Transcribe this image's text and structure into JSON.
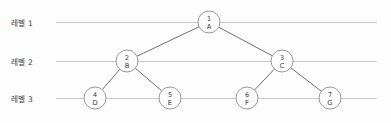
{
  "diagram": {
    "type": "binary-tree",
    "title": "",
    "background_color": "#fdfdfd",
    "level_line_color": "#c9c9c9",
    "edge_color": "#6f6f72",
    "node_stroke_color": "#8d8d91",
    "node_fill_color": "#fdfdfd",
    "levels": [
      {
        "label": "레벨 1",
        "y": 22,
        "line_start_x": 56,
        "line_end_x": 377
      },
      {
        "label": "레벨 2",
        "y": 61,
        "line_start_x": 56,
        "line_end_x": 377
      },
      {
        "label": "레벨 3",
        "y": 98,
        "line_start_x": 56,
        "line_end_x": 377
      }
    ],
    "nodes": [
      {
        "id": "A",
        "number": "1",
        "letter": "A",
        "cx": 209,
        "cy": 22,
        "r": 11,
        "level": 1
      },
      {
        "id": "B",
        "number": "2",
        "letter": "B",
        "cx": 127,
        "cy": 61,
        "r": 11,
        "level": 2
      },
      {
        "id": "C",
        "number": "3",
        "letter": "C",
        "cx": 282,
        "cy": 61,
        "r": 11,
        "level": 2
      },
      {
        "id": "D",
        "number": "4",
        "letter": "D",
        "cx": 95,
        "cy": 98,
        "r": 11,
        "level": 3
      },
      {
        "id": "E",
        "number": "5",
        "letter": "E",
        "cx": 170,
        "cy": 98,
        "r": 11,
        "level": 3
      },
      {
        "id": "F",
        "number": "6",
        "letter": "F",
        "cx": 247,
        "cy": 98,
        "r": 11,
        "level": 3
      },
      {
        "id": "G",
        "number": "7",
        "letter": "G",
        "cx": 330,
        "cy": 98,
        "r": 11,
        "level": 3
      }
    ],
    "edges": [
      {
        "from": "A",
        "to": "B"
      },
      {
        "from": "A",
        "to": "C"
      },
      {
        "from": "B",
        "to": "D"
      },
      {
        "from": "B",
        "to": "E"
      },
      {
        "from": "C",
        "to": "F"
      },
      {
        "from": "C",
        "to": "G"
      }
    ]
  }
}
